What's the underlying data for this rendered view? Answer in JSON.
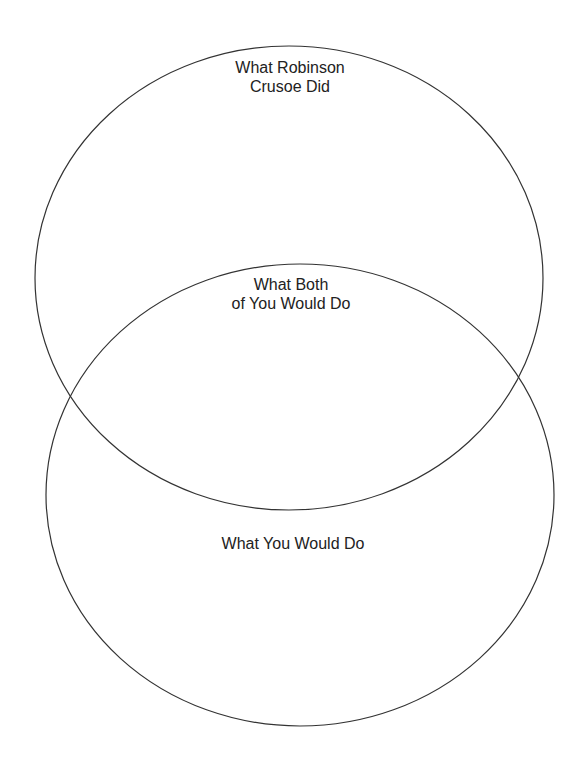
{
  "diagram": {
    "type": "venn",
    "stroke_color": "#333333",
    "background": "#ffffff",
    "circles": [
      {
        "id": "top",
        "label_lines": [
          "What Robinson",
          "Crusoe Did"
        ],
        "cx": 289,
        "cy": 278,
        "rx": 254,
        "ry": 232
      },
      {
        "id": "bottom",
        "label_lines": [
          "What You Would Do"
        ],
        "cx": 300,
        "cy": 495,
        "rx": 254,
        "ry": 231
      }
    ],
    "intersection": {
      "label_lines": [
        "What Both",
        "of You Would Do"
      ]
    }
  }
}
